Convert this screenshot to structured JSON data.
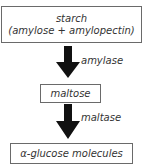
{
  "diagram": {
    "type": "flow",
    "direction": "top-to-bottom",
    "nodes": [
      {
        "id": "starch",
        "line1": "starch",
        "line2": "(amylose + amylopectin)"
      },
      {
        "id": "maltose",
        "label": "maltose"
      },
      {
        "id": "glucose",
        "label": "α-glucose molecules"
      }
    ],
    "edges": [
      {
        "from": "starch",
        "to": "maltose",
        "label": "amylase"
      },
      {
        "from": "maltose",
        "to": "glucose",
        "label": "maltase"
      }
    ],
    "colors": {
      "arrow": "#111111",
      "box_border": "#6a6a6a",
      "text": "#333333"
    }
  }
}
